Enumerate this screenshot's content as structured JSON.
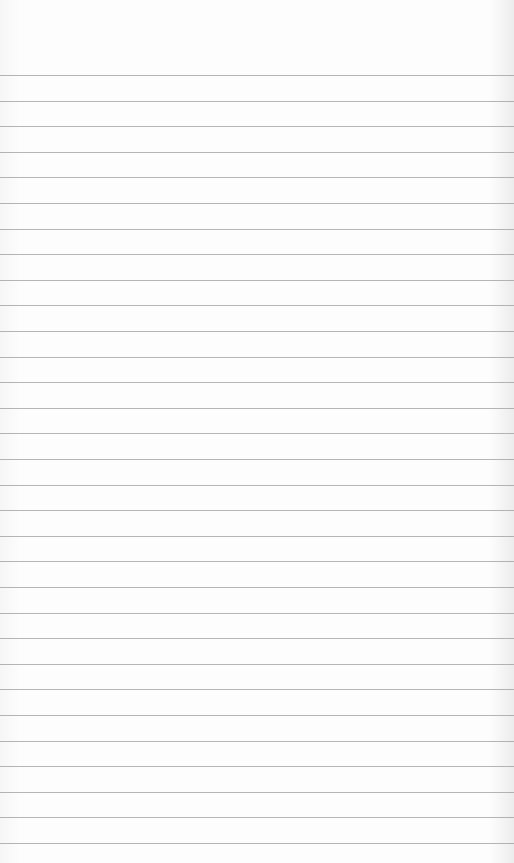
{
  "paper": {
    "type": "lined-paper",
    "background_color": "#fbfbfb",
    "line_color": "#9c9c9c",
    "first_line_y": 75,
    "line_spacing": 25.6,
    "line_count": 31
  }
}
